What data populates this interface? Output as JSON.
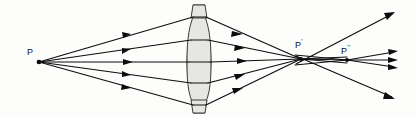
{
  "figure": {
    "kind": "optics-ray-diagram",
    "width": 417,
    "height": 117,
    "background_color": "#fdfdfc"
  },
  "colors": {
    "ray": "#0d0d0d",
    "lens_fill": "#e6e6e3",
    "lens_stroke": "#3b3b3b",
    "label_text": "#111111"
  },
  "labels": {
    "object_point": {
      "text": "P",
      "prime": ""
    },
    "first_image_point": {
      "text": "P",
      "prime": "'"
    },
    "second_image_point": {
      "text": "P",
      "prime": "''"
    }
  },
  "points": {
    "P": {
      "x": 39,
      "y": 62
    },
    "P1": {
      "x": 301,
      "y": 59
    },
    "P2": {
      "x": 347,
      "y": 60
    }
  },
  "lens": {
    "center_x": 199,
    "top_y": 5,
    "bottom_y": 113,
    "half_thickness": 12,
    "description": "biconvex converging lens, light gray fill"
  },
  "incident_rays": [
    {
      "id": "ray-1-up-outer",
      "from_x": 39,
      "from_y": 62,
      "to_x": 193,
      "to_y": 17,
      "arrow_t": 0.57
    },
    {
      "id": "ray-2-up-inner",
      "from_x": 39,
      "from_y": 62,
      "to_x": 191,
      "to_y": 40,
      "arrow_t": 0.57
    },
    {
      "id": "ray-3-axial",
      "from_x": 39,
      "from_y": 62,
      "to_x": 189,
      "to_y": 62,
      "arrow_t": 0.57
    },
    {
      "id": "ray-4-down-inner",
      "from_x": 39,
      "from_y": 62,
      "to_x": 191,
      "to_y": 83,
      "arrow_t": 0.57
    },
    {
      "id": "ray-5-down-outer",
      "from_x": 39,
      "from_y": 62,
      "to_x": 193,
      "to_y": 105,
      "arrow_t": 0.57
    }
  ],
  "refracted_rays": [
    {
      "id": "conv-1",
      "from_x": 206,
      "from_y": 17,
      "to_x": 301,
      "to_y": 59,
      "arrow_t": 0.34
    },
    {
      "id": "conv-2",
      "from_x": 208,
      "from_y": 40,
      "to_x": 301,
      "to_y": 59,
      "arrow_t": 0.34
    },
    {
      "id": "conv-3",
      "from_x": 210,
      "from_y": 62,
      "to_x": 301,
      "to_y": 59,
      "arrow_t": 0.34
    },
    {
      "id": "conv-4",
      "from_x": 208,
      "from_y": 83,
      "to_x": 301,
      "to_y": 59,
      "arrow_t": 0.34
    },
    {
      "id": "conv-5",
      "from_x": 206,
      "from_y": 105,
      "to_x": 301,
      "to_y": 59,
      "arrow_t": 0.34
    }
  ],
  "crossover_rays": [
    {
      "id": "cross-1",
      "from_x": 301,
      "from_y": 59,
      "to_x": 347,
      "to_y": 60
    },
    {
      "id": "cross-2",
      "from_x": 301,
      "from_y": 59,
      "to_x": 347,
      "to_y": 60
    },
    {
      "id": "cross-3",
      "from_x": 301,
      "from_y": 59,
      "to_x": 347,
      "to_y": 60
    }
  ],
  "emergent_rays": [
    {
      "id": "out-1-up-steep",
      "from_x": 297,
      "from_y": 64,
      "to_x": 394,
      "to_y": 13,
      "arrow_t": 1.0
    },
    {
      "id": "out-2-up-shallow",
      "from_x": 347,
      "from_y": 60,
      "to_x": 396,
      "to_y": 52,
      "arrow_t": 1.0
    },
    {
      "id": "out-3-axial",
      "from_x": 347,
      "from_y": 60,
      "to_x": 397,
      "to_y": 60,
      "arrow_t": 1.0
    },
    {
      "id": "out-4-down-shallow",
      "from_x": 347,
      "from_y": 60,
      "to_x": 396,
      "to_y": 67,
      "arrow_t": 1.0
    },
    {
      "id": "out-5-down-steep",
      "from_x": 297,
      "from_y": 56,
      "to_x": 394,
      "to_y": 98,
      "arrow_t": 1.0
    }
  ]
}
